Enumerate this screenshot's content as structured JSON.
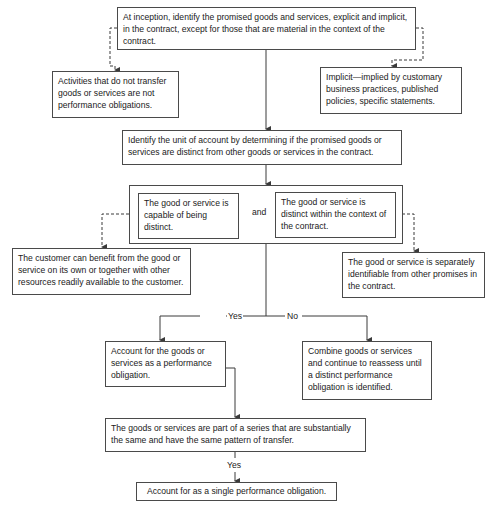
{
  "flowchart": {
    "inception": "At inception, identify the promised goods and services, explicit and implicit, in the contract, except for those that are material in the context of the contract.",
    "activities": "Activities that do not transfer goods or services are not performance obligations.",
    "implicit": "Implicit—implied by customary business practices, published policies, specific statements.",
    "unit_of_account": "Identify the unit of account by determining if the promised goods or services are distinct from other goods or services in the contract.",
    "capable_distinct": "The good or service is capable of being distinct.",
    "and_label": "and",
    "distinct_context": "The good or service is distinct within the context of the contract.",
    "customer_benefit": "The customer can benefit from the good or service on its own or together with other resources readily available to the customer.",
    "separately_identifiable": "The good or service is separately identifiable from other promises in the contract.",
    "yes_label": "Yes",
    "no_label": "No",
    "account_po": "Account for the goods or services as a performance obligation.",
    "combine": "Combine goods or services and continue to reassess until a distinct performance obligation is identified.",
    "series": "The goods or services are part of a series that are substantially the same and have the same pattern of transfer.",
    "series_yes_label": "Yes",
    "single_po": "Account for as a single performance obligation."
  },
  "colors": {
    "line": "#3a3a3a",
    "border": "#4a4a4a",
    "text": "#1a1a1a"
  }
}
